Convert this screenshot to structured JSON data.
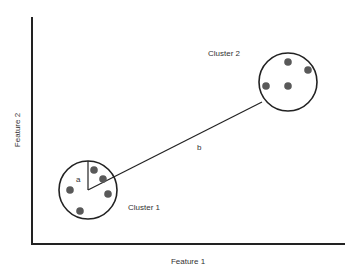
{
  "diagram": {
    "type": "cluster-distance-diagram",
    "x_axis_label": "Feature 1",
    "y_axis_label": "Feature 2",
    "clusters": [
      {
        "label": "Cluster 1",
        "center": [
          88,
          190
        ],
        "radius": 29,
        "points": [
          [
            94,
            170
          ],
          [
            103,
            179
          ],
          [
            108,
            194
          ],
          [
            70,
            190
          ],
          [
            80,
            211
          ]
        ],
        "radius_label": "a"
      },
      {
        "label": "Cluster 2",
        "center": [
          288,
          82
        ],
        "radius": 29,
        "points": [
          [
            288,
            62
          ],
          [
            308,
            70
          ],
          [
            266,
            86
          ],
          [
            288,
            86
          ]
        ]
      }
    ],
    "distance_label": "b",
    "colors": {
      "axis": "#222222",
      "circle": "#222222",
      "point": "#595959",
      "text": "#333333",
      "background": "#ffffff"
    }
  }
}
